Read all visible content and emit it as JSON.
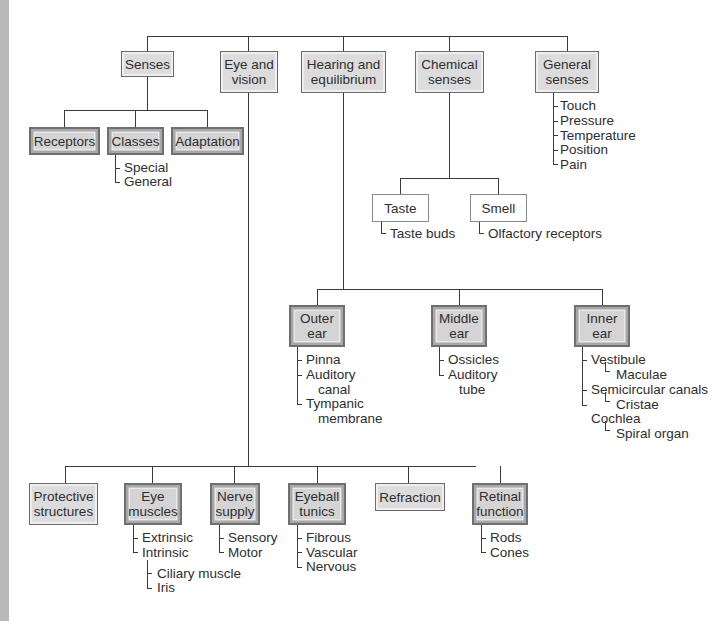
{
  "diagram": {
    "type": "concept-map",
    "top_level": [
      {
        "id": "senses",
        "label": "Senses",
        "children": [
          {
            "label": "Receptors"
          },
          {
            "label": "Classes",
            "items": [
              "Special",
              "General"
            ]
          },
          {
            "label": "Adaptation"
          }
        ]
      },
      {
        "id": "eye",
        "label": "Eye and vision",
        "children": [
          {
            "label": "Protective structures"
          },
          {
            "label": "Eye muscles",
            "items": [
              "Extrinsic",
              "Intrinsic"
            ],
            "subitems": [
              "Ciliary muscle",
              "Iris"
            ]
          },
          {
            "label": "Nerve supply",
            "items": [
              "Sensory",
              "Motor"
            ]
          },
          {
            "label": "Eyeball tunics",
            "items": [
              "Fibrous",
              "Vascular",
              "Nervous"
            ]
          },
          {
            "label": "Refraction"
          },
          {
            "label": "Retinal function",
            "items": [
              "Rods",
              "Cones"
            ]
          }
        ]
      },
      {
        "id": "hearing",
        "label": "Hearing and equilibrium",
        "children": [
          {
            "label": "Outer ear",
            "items": [
              "Pinna",
              "Auditory canal",
              "Tympanic membrane"
            ]
          },
          {
            "label": "Middle ear",
            "items": [
              "Ossicles",
              "Auditory tube"
            ]
          },
          {
            "label": "Inner ear",
            "items": [
              "Vestibule",
              "Maculae",
              "Semicircular canals",
              "Cristae",
              "Cochlea",
              "Spiral organ"
            ]
          }
        ]
      },
      {
        "id": "chemical",
        "label": "Chemical senses",
        "children": [
          {
            "label": "Taste",
            "items": [
              "Taste buds"
            ]
          },
          {
            "label": "Smell",
            "items": [
              "Olfactory receptors"
            ]
          }
        ]
      },
      {
        "id": "general",
        "label": "General senses",
        "items": [
          "Touch",
          "Pressure",
          "Temperature",
          "Position",
          "Pain"
        ]
      }
    ]
  },
  "boxes": {
    "senses": "Senses",
    "eye_l1": "Eye and",
    "eye_l2": "vision",
    "hearing_l1": "Hearing and",
    "hearing_l2": "equilibrium",
    "chemical_l1": "Chemical",
    "chemical_l2": "senses",
    "general_l1": "General",
    "general_l2": "senses",
    "receptors": "Receptors",
    "classes": "Classes",
    "adaptation": "Adaptation",
    "taste": "Taste",
    "smell": "Smell",
    "outer_l1": "Outer",
    "outer_l2": "ear",
    "middle_l1": "Middle",
    "middle_l2": "ear",
    "inner_l1": "Inner",
    "inner_l2": "ear",
    "protective_l1": "Protective",
    "protective_l2": "structures",
    "muscles_l1": "Eye",
    "muscles_l2": "muscles",
    "nerve_l1": "Nerve",
    "nerve_l2": "supply",
    "tunics_l1": "Eyeball",
    "tunics_l2": "tunics",
    "refraction": "Refraction",
    "retinal_l1": "Retinal",
    "retinal_l2": "function"
  },
  "labels": {
    "classes": [
      "Special",
      "General"
    ],
    "general": [
      "Touch",
      "Pressure",
      "Temperature",
      "Position",
      "Pain"
    ],
    "taste": "Taste buds",
    "smell": "Olfactory receptors",
    "outer": [
      "Pinna",
      "Auditory",
      "canal",
      "Tympanic",
      "membrane"
    ],
    "middle": [
      "Ossicles",
      "Auditory",
      "tube"
    ],
    "inner": [
      "Vestibule",
      "Maculae",
      "Semicircular canals",
      "Cristae",
      "Cochlea",
      "Spiral organ"
    ],
    "muscles": [
      "Extrinsic",
      "Intrinsic"
    ],
    "intrinsic": [
      "Ciliary muscle",
      "Iris"
    ],
    "nerve": [
      "Sensory",
      "Motor"
    ],
    "tunics": [
      "Fibrous",
      "Vascular",
      "Nervous"
    ],
    "retinal": [
      "Rods",
      "Cones"
    ]
  }
}
